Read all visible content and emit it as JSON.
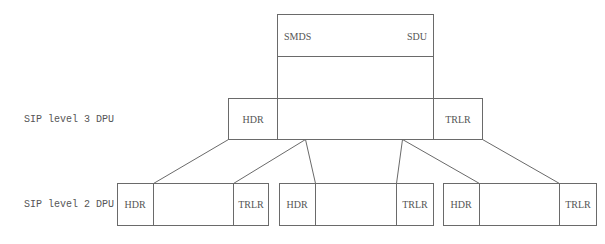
{
  "diagram": {
    "sdu_box": {
      "left_label": "SMDS",
      "right_label": "SDU"
    },
    "level3": {
      "row_label": "SIP level 3 DPU",
      "header_label": "HDR",
      "trailer_label": "TRLR"
    },
    "level2": {
      "row_label": "SIP level 2 DPU",
      "segments": [
        {
          "header_label": "HDR",
          "trailer_label": "TRLR"
        },
        {
          "header_label": "HDR",
          "trailer_label": "TRLR"
        },
        {
          "header_label": "HDR",
          "trailer_label": "TRLR"
        }
      ]
    },
    "colors": {
      "line": "#6a6a6a",
      "text": "#555555",
      "background": "#ffffff"
    }
  }
}
